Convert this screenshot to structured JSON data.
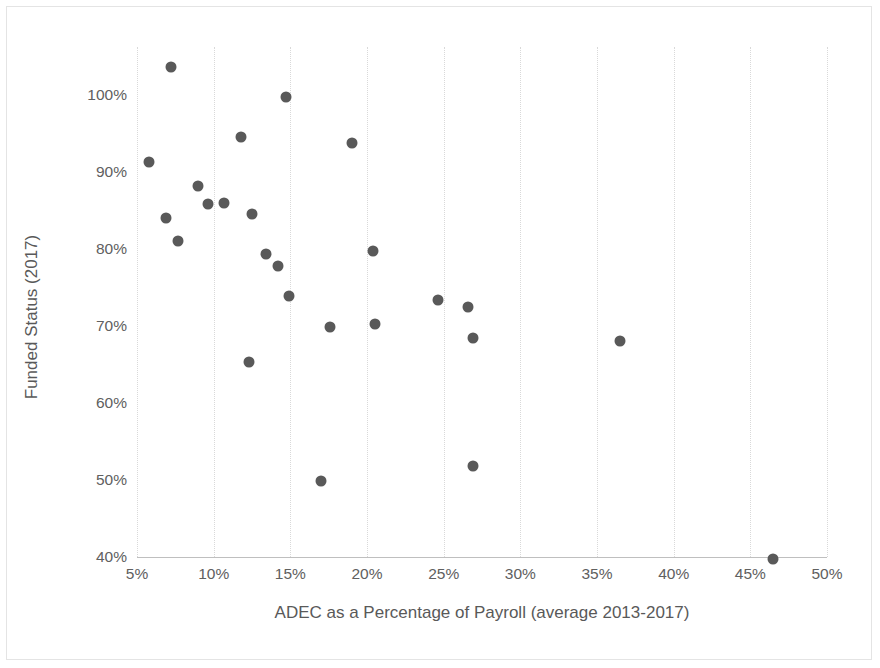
{
  "chart_data": {
    "type": "scatter",
    "title": "",
    "xlabel": "ADEC as a Percentage of Payroll (average 2013-2017)",
    "ylabel": "Funded Status (2017)",
    "xlim": [
      5,
      50
    ],
    "ylim": [
      40,
      100
    ],
    "xticks": [
      5,
      10,
      15,
      20,
      25,
      30,
      35,
      40,
      45,
      50
    ],
    "yticks": [
      40,
      50,
      60,
      70,
      80,
      90,
      100
    ],
    "xtick_labels": [
      "5%",
      "10%",
      "15%",
      "20%",
      "25%",
      "30%",
      "35%",
      "40%",
      "45%",
      "50%"
    ],
    "ytick_labels": [
      "40%",
      "50%",
      "60%",
      "70%",
      "80%",
      "90%",
      "100%"
    ],
    "grid": "vertical-dotted",
    "legend": "none",
    "marker_color": "#595959",
    "marker_shape": "circle",
    "points": [
      {
        "x": 5.8,
        "y": 91.3
      },
      {
        "x": 6.9,
        "y": 84.0
      },
      {
        "x": 7.2,
        "y": 103.6
      },
      {
        "x": 7.7,
        "y": 81.0
      },
      {
        "x": 9.0,
        "y": 88.2
      },
      {
        "x": 9.6,
        "y": 85.9
      },
      {
        "x": 10.7,
        "y": 86.0
      },
      {
        "x": 11.8,
        "y": 94.5
      },
      {
        "x": 12.3,
        "y": 65.3
      },
      {
        "x": 12.5,
        "y": 84.6
      },
      {
        "x": 13.4,
        "y": 79.3
      },
      {
        "x": 14.2,
        "y": 77.8
      },
      {
        "x": 14.7,
        "y": 99.8
      },
      {
        "x": 14.9,
        "y": 73.9
      },
      {
        "x": 17.0,
        "y": 49.9
      },
      {
        "x": 17.6,
        "y": 69.9
      },
      {
        "x": 19.0,
        "y": 93.8
      },
      {
        "x": 20.4,
        "y": 79.8
      },
      {
        "x": 20.5,
        "y": 70.2
      },
      {
        "x": 24.6,
        "y": 73.4
      },
      {
        "x": 26.6,
        "y": 72.5
      },
      {
        "x": 26.9,
        "y": 68.5
      },
      {
        "x": 26.9,
        "y": 51.8
      },
      {
        "x": 36.5,
        "y": 68.1
      },
      {
        "x": 46.5,
        "y": 39.8
      }
    ]
  }
}
